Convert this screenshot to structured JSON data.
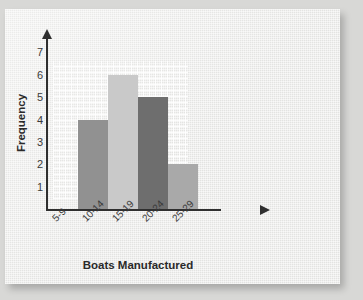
{
  "card": {
    "background_color": "#e9e9e7",
    "page_background_color": "#d8d8d6"
  },
  "chart_data": {
    "type": "bar",
    "title": "",
    "subtitle": "",
    "xlabel": "Boats Manufactured",
    "ylabel": "Frequency",
    "categories": [
      "5-9",
      "10-14",
      "15-19",
      "20-24",
      "25-29"
    ],
    "values": [
      0,
      4,
      6,
      5,
      2
    ],
    "bar_colors": [
      "#9a9a9a",
      "#919191",
      "#c9c9c9",
      "#6e6e6e",
      "#a9a9a9"
    ],
    "ylim": [
      0,
      7.6
    ],
    "yticks": [
      7,
      6,
      5,
      4,
      3,
      2,
      1
    ],
    "ytick_labels": [
      "7",
      "6",
      "5",
      "4",
      "3",
      "2",
      "1"
    ],
    "grid": true,
    "grid_color": "#ffffff",
    "legend": null,
    "axis_color": "#2f2f2f",
    "x_tick_label_rotation": -45,
    "annotations": []
  },
  "axes": {
    "x_axis_name": "x-axis-with-arrow",
    "y_axis_name": "y-axis-with-arrow"
  }
}
